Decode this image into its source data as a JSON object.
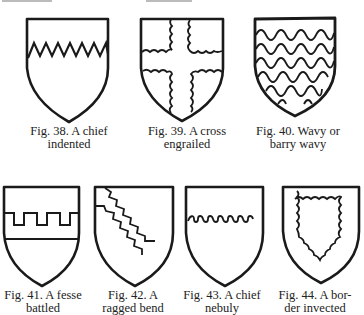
{
  "top_fragment": "partial text line cut off at top of page",
  "figures": [
    {
      "id": "fig38",
      "number": "Fig. 38.",
      "line1": "Fig. 38.  A chief",
      "line2": "indented",
      "charge": "chief indented"
    },
    {
      "id": "fig39",
      "number": "Fig. 39.",
      "line1": "Fig. 39.  A cross",
      "line2": "engrailed",
      "charge": "cross engrailed"
    },
    {
      "id": "fig40",
      "number": "Fig. 40.",
      "line1": "Fig. 40.  Wavy or",
      "line2": "barry wavy",
      "charge": "barry wavy"
    },
    {
      "id": "fig41",
      "number": "Fig. 41.",
      "line1": "Fig. 41.  A fesse",
      "line2": "battled",
      "charge": "fesse battled"
    },
    {
      "id": "fig42",
      "number": "Fig. 42.",
      "line1": "Fig. 42.  A",
      "line2": "ragged bend",
      "charge": "ragged bend"
    },
    {
      "id": "fig43",
      "number": "Fig. 43.",
      "line1": "Fig. 43.  A chief",
      "line2": "nebuly",
      "charge": "chief nebuly"
    },
    {
      "id": "fig44",
      "number": "Fig. 44.",
      "line1": "Fig. 44.  A bor-",
      "line2": "der invected",
      "charge": "border invected"
    }
  ],
  "colors": {
    "ink": "#1a1a1a",
    "paper": "#ffffff"
  }
}
